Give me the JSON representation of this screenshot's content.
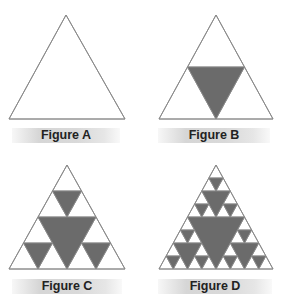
{
  "colors": {
    "fill": "#6b6b6b",
    "stroke": "#8a8a8a",
    "background": "#ffffff"
  },
  "figures": [
    {
      "id": "A",
      "label": "Figure A",
      "level": 0,
      "apex": [
        66,
        15
      ],
      "left": [
        9,
        119
      ],
      "right": [
        125,
        119
      ],
      "label_box": [
        12,
        128,
        108
      ]
    },
    {
      "id": "B",
      "label": "Figure B",
      "level": 1,
      "apex": [
        216,
        15
      ],
      "left": [
        159,
        119
      ],
      "right": [
        273,
        119
      ],
      "label_box": [
        158,
        128,
        112
      ]
    },
    {
      "id": "C",
      "label": "Figure C",
      "level": 2,
      "apex": [
        67,
        165
      ],
      "left": [
        9,
        269
      ],
      "right": [
        125,
        269
      ],
      "label_box": [
        12,
        279,
        110
      ]
    },
    {
      "id": "D",
      "label": "Figure D",
      "level": 3,
      "apex": [
        216,
        165
      ],
      "left": [
        159,
        269
      ],
      "right": [
        273,
        269
      ],
      "label_box": [
        158,
        279,
        114
      ]
    }
  ]
}
